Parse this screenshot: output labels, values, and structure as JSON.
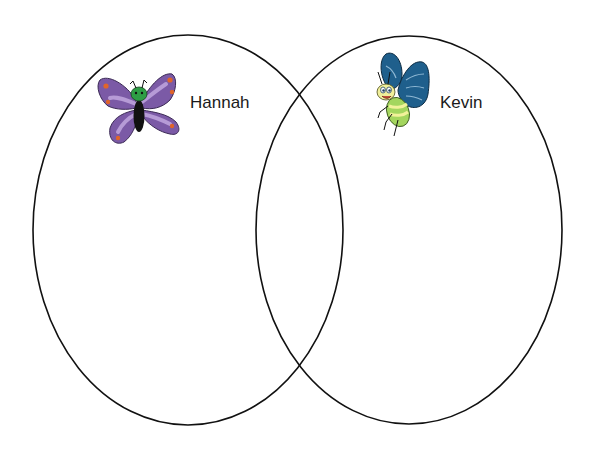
{
  "diagram": {
    "type": "venn",
    "sets": [
      {
        "id": "left",
        "label": "Hannah",
        "icon": "purple-butterfly-icon",
        "color": "#7a55a3",
        "ellipse": {
          "cx": 188,
          "cy": 230,
          "rx": 155,
          "ry": 195
        }
      },
      {
        "id": "right",
        "label": "Kevin",
        "icon": "blue-butterfly-icon",
        "color": "#1f5f8c",
        "ellipse": {
          "cx": 409,
          "cy": 230,
          "rx": 153,
          "ry": 194
        }
      }
    ],
    "stroke_color": "#111111",
    "background": "#ffffff"
  }
}
